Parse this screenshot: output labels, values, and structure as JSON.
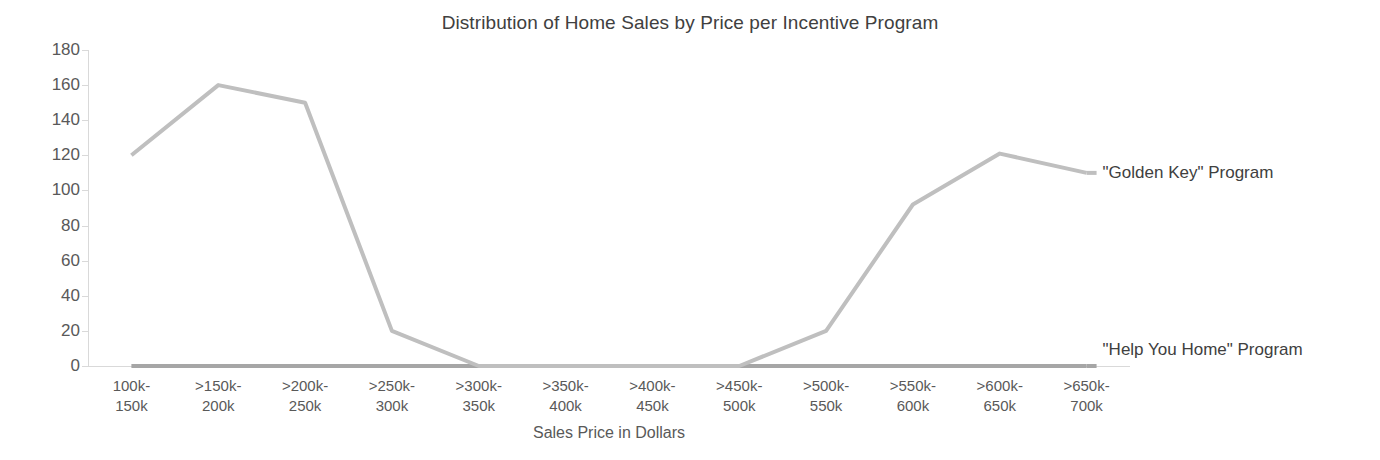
{
  "chart_data": {
    "type": "line",
    "title": "Distribution of Home Sales by Price per Incentive Program",
    "xlabel": "Sales Price in Dollars",
    "ylabel": "",
    "categories": [
      "100k-\n150k",
      ">150k-\n200k",
      ">200k-\n250k",
      ">250k-\n300k",
      ">300k-\n350k",
      ">350k-\n400k",
      ">400k-\n450k",
      ">450k-\n500k",
      ">500k-\n550k",
      ">550k-\n600k",
      ">600k-\n650k",
      ">650k-\n700k"
    ],
    "category_lines": [
      [
        "100k-",
        "150k"
      ],
      [
        ">150k-",
        "200k"
      ],
      [
        ">200k-",
        "250k"
      ],
      [
        ">250k-",
        "300k"
      ],
      [
        ">300k-",
        "350k"
      ],
      [
        ">350k-",
        "400k"
      ],
      [
        ">400k-",
        "450k"
      ],
      [
        ">450k-",
        "500k"
      ],
      [
        ">500k-",
        "550k"
      ],
      [
        ">550k-",
        "600k"
      ],
      [
        ">600k-",
        "650k"
      ],
      [
        ">650k-",
        "700k"
      ]
    ],
    "series": [
      {
        "name": "\"Golden Key\" Program",
        "color": "#bfbfbf",
        "values": [
          120,
          160,
          150,
          20,
          0,
          0,
          0,
          0,
          20,
          92,
          121,
          110
        ]
      },
      {
        "name": "\"Help You Home\" Program",
        "color": "#a6a6a6",
        "values": [
          0,
          0,
          0,
          0,
          0,
          0,
          0,
          0,
          0,
          0,
          0,
          0
        ]
      }
    ],
    "ylim": [
      0,
      180
    ],
    "yticks": [
      0,
      20,
      40,
      60,
      80,
      100,
      120,
      140,
      160,
      180
    ],
    "ytick_labels": [
      "0",
      "20",
      "40",
      "60",
      "80",
      "100",
      "120",
      "140",
      "160",
      "180"
    ],
    "grid": false,
    "legend_position": "right-inline",
    "legend": [
      {
        "label": "\"Golden Key\" Program",
        "color": "#bfbfbf"
      },
      {
        "label": "\"Help You Home\" Program",
        "color": "#a6a6a6"
      }
    ]
  }
}
